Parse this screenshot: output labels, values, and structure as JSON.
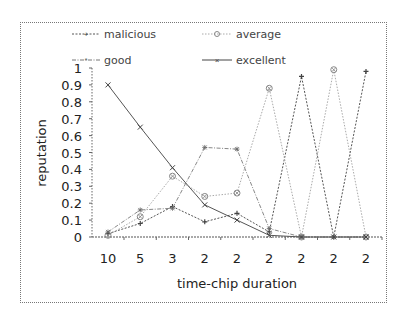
{
  "chart_data": {
    "type": "line",
    "title": "",
    "xlabel": "time-chip duration",
    "ylabel": "reputation",
    "categories": [
      "10",
      "5",
      "3",
      "2",
      "2",
      "2",
      "2",
      "2",
      "2"
    ],
    "yticks": [
      "0",
      "0.1",
      "0.2",
      "0.3",
      "0.4",
      "0.5",
      "0.6",
      "0.7",
      "0.8",
      "0.9",
      "1"
    ],
    "ylim": [
      0,
      1
    ],
    "grid": false,
    "legend_position": "top",
    "series": [
      {
        "name": "malicious",
        "style": "dotted",
        "marker": "plus",
        "values": [
          0.02,
          0.08,
          0.18,
          0.09,
          0.14,
          0.03,
          0.95,
          0.0,
          0.98
        ]
      },
      {
        "name": "average",
        "style": "dotted",
        "marker": "circle-x",
        "values": [
          0.01,
          0.12,
          0.36,
          0.24,
          0.26,
          0.88,
          0.0,
          0.99,
          0.0
        ]
      },
      {
        "name": "good",
        "style": "dash-dot",
        "marker": "star",
        "values": [
          0.03,
          0.16,
          0.17,
          0.53,
          0.52,
          0.05,
          0.0,
          0.0,
          0.0
        ]
      },
      {
        "name": "excellent",
        "style": "solid",
        "marker": "x",
        "values": [
          0.9,
          0.65,
          0.41,
          0.19,
          0.1,
          0.01,
          0.0,
          0.0,
          0.0
        ]
      }
    ]
  },
  "legend": {
    "malicious": "malicious",
    "average": "average",
    "good": "good",
    "excellent": "excellent"
  },
  "axes": {
    "xlabel": "time-chip duration",
    "ylabel": "reputation"
  }
}
